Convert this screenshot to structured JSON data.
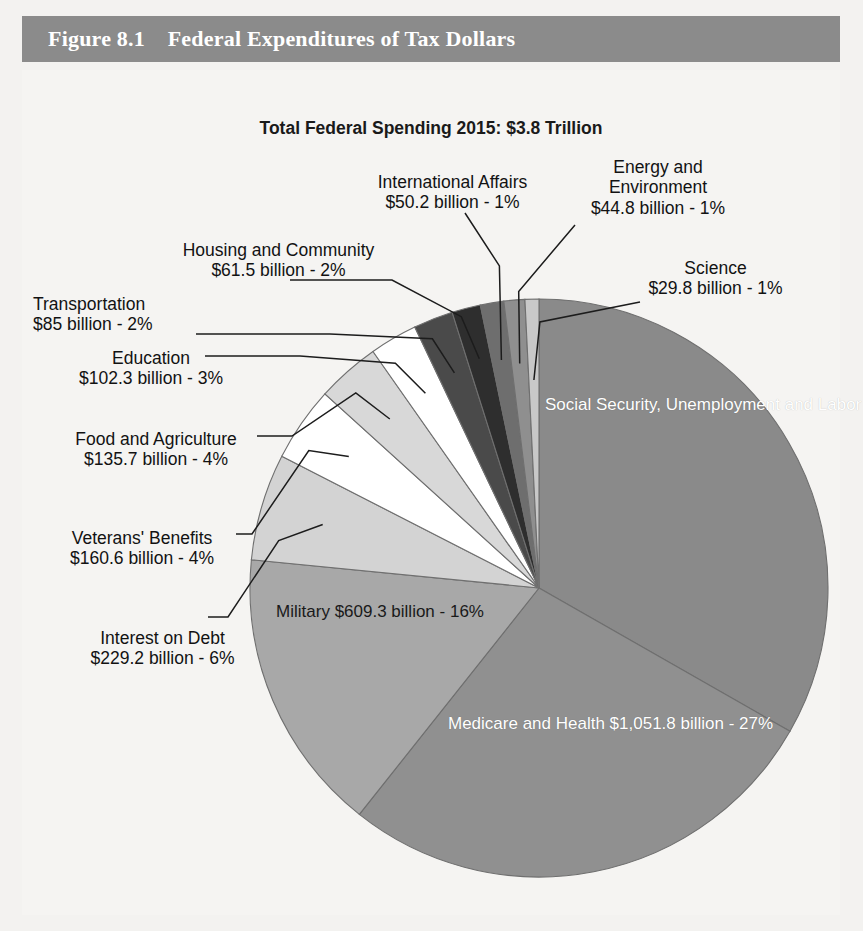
{
  "header": {
    "figure_number": "Figure 8.1",
    "figure_title": "Federal Expenditures of Tax Dollars",
    "full": "Figure 8.1    Federal Expenditures of Tax Dollars",
    "bar_color": "#8b8b8b",
    "text_color": "#ffffff"
  },
  "chart_data": {
    "type": "pie",
    "title": "Total Federal Spending 2015: $3.8 Trillion",
    "total": "$3.8 Trillion",
    "year": "2015",
    "units": "billions of US dollars",
    "start_angle_deg": 0,
    "direction": "clockwise",
    "legend": "none (labels with leader lines)",
    "categories": [
      "Social Security, Unemployment and Labor",
      "Medicare and Health",
      "Military",
      "Interest on Debt",
      "Veterans' Benefits",
      "Food and Agriculture",
      "Education",
      "Transportation",
      "Housing and Community",
      "International Affairs",
      "Energy and Environment",
      "Science"
    ],
    "values": [
      1275.7,
      1051.8,
      609.3,
      229.2,
      160.6,
      135.7,
      102.3,
      85,
      61.5,
      50.2,
      44.8,
      29.8
    ],
    "percents": [
      33,
      27,
      16,
      6,
      4,
      4,
      3,
      2,
      2,
      1,
      1,
      1
    ],
    "colors": [
      "#8a8a8a",
      "#909090",
      "#a8a8a8",
      "#d3d3d3",
      "#ffffff",
      "#d8d8d8",
      "#ffffff",
      "#4a4a4a",
      "#2e2e2e",
      "#6e6e6e",
      "#8f8f8f",
      "#c8c8c8"
    ],
    "slices": [
      {
        "name": "Social Security, Unemployment and Labor",
        "label_line1": "Social Security,",
        "label_line2": "Unemployment and",
        "label_line3": "Labor",
        "value_text": "$1,275.7 billion - 33%",
        "value": 1275.7,
        "percent": 33,
        "placement": "inside",
        "color": "#8a8a8a"
      },
      {
        "name": "Medicare and Health",
        "label_line1": "Medicare and Health",
        "value_text": "$1,051.8 billion - 27%",
        "value": 1051.8,
        "percent": 27,
        "placement": "inside",
        "color": "#909090"
      },
      {
        "name": "Military",
        "label_line1": "Military",
        "value_text": "$609.3 billion - 16%",
        "value": 609.3,
        "percent": 16,
        "placement": "inside",
        "color": "#a8a8a8"
      },
      {
        "name": "Interest on Debt",
        "label_line1": "Interest on Debt",
        "value_text": "$229.2 billion - 6%",
        "value": 229.2,
        "percent": 6,
        "placement": "outside-left",
        "color": "#d3d3d3"
      },
      {
        "name": "Veterans' Benefits",
        "label_line1": "Veterans' Benefits",
        "value_text": "$160.6 billion - 4%",
        "value": 160.6,
        "percent": 4,
        "placement": "outside-left",
        "color": "#ffffff"
      },
      {
        "name": "Food and Agriculture",
        "label_line1": "Food and Agriculture",
        "value_text": "$135.7 billion - 4%",
        "value": 135.7,
        "percent": 4,
        "placement": "outside-left",
        "color": "#d8d8d8"
      },
      {
        "name": "Education",
        "label_line1": "Education",
        "value_text": "$102.3 billion - 3%",
        "value": 102.3,
        "percent": 3,
        "placement": "outside-left",
        "color": "#ffffff"
      },
      {
        "name": "Transportation",
        "label_line1": "Transportation",
        "value_text": "$85 billion - 2%",
        "value": 85,
        "percent": 2,
        "placement": "outside-left",
        "color": "#4a4a4a"
      },
      {
        "name": "Housing and Community",
        "label_line1": "Housing and Community",
        "value_text": "$61.5 billion - 2%",
        "value": 61.5,
        "percent": 2,
        "placement": "outside-left",
        "color": "#2e2e2e"
      },
      {
        "name": "International Affairs",
        "label_line1": "International Affairs",
        "value_text": "$50.2 billion - 1%",
        "value": 50.2,
        "percent": 1,
        "placement": "outside-top",
        "color": "#6e6e6e"
      },
      {
        "name": "Energy and Environment",
        "label_line1": "Energy and",
        "label_line2": "Environment",
        "value_text": "$44.8 billion - 1%",
        "value": 44.8,
        "percent": 1,
        "placement": "outside-top",
        "color": "#8f8f8f"
      },
      {
        "name": "Science",
        "label_line1": "Science",
        "value_text": "$29.8 billion - 1%",
        "value": 29.8,
        "percent": 1,
        "placement": "outside-right",
        "color": "#c8c8c8"
      }
    ]
  }
}
